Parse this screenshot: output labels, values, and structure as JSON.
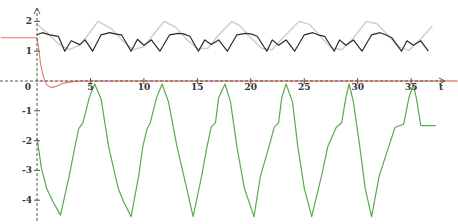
{
  "chart_data": {
    "type": "line",
    "title": "",
    "xlabel": "t",
    "ylabel": "",
    "xlim": [
      -3.4,
      39.3
    ],
    "ylim": [
      -4.7,
      2.6
    ],
    "x_ticks": [
      0,
      5,
      10,
      15,
      20,
      25,
      30,
      35
    ],
    "x_tick_labels": [
      "0",
      "5",
      "10",
      "15",
      "20",
      "25",
      "30",
      "35"
    ],
    "y_ticks": [
      2,
      1,
      -1,
      -2,
      -3,
      -4
    ],
    "y_tick_labels": [
      "2",
      "1",
      "-1",
      "-2",
      "-3",
      "-4"
    ],
    "grid": false,
    "legend": null,
    "colors": {
      "axis": "#555555",
      "black_curve": "#2a2a2a",
      "gray_curve": "#cccccc",
      "red_curve": "#e07a6a",
      "red_zero_line": "#f3a8a0",
      "green_curve": "#5aaa50"
    },
    "series": [
      {
        "name": "gray-sinusoid",
        "description": "faint gray sinusoid, period ~2π",
        "x": [
          0,
          1,
          2,
          3,
          4,
          5,
          5.7,
          7,
          8,
          9,
          10,
          11,
          11.9,
          13,
          14,
          15,
          16,
          17,
          18.2,
          19,
          20,
          21,
          22,
          23,
          24.5,
          25.5,
          26.5,
          27.5,
          28.5,
          29.5,
          30.8,
          31.8,
          32.8,
          33.8,
          34.8,
          36,
          37
        ],
        "y": [
          1.9,
          1.6,
          1.25,
          1.05,
          1.2,
          1.65,
          2.0,
          1.75,
          1.35,
          1.05,
          1.15,
          1.6,
          2.0,
          1.8,
          1.4,
          1.08,
          1.1,
          1.55,
          2.0,
          1.85,
          1.45,
          1.1,
          1.05,
          1.45,
          2.0,
          1.9,
          1.5,
          1.12,
          1.05,
          1.4,
          2.0,
          1.92,
          1.55,
          1.15,
          1.02,
          1.45,
          1.85
        ]
      },
      {
        "name": "black-oscillation",
        "description": "dark curve with double dips each period",
        "x": [
          0,
          0.5,
          1.2,
          2,
          2.6,
          3.2,
          4,
          4.5,
          5.2,
          6,
          6.8,
          7.3,
          7.9,
          8.8,
          9.4,
          10,
          10.7,
          11.5,
          12.4,
          13.2,
          13.7,
          14.3,
          15.1,
          15.7,
          16.3,
          17,
          17.8,
          18.7,
          19.5,
          20,
          20.6,
          21.5,
          22,
          22.6,
          23.3,
          24.1,
          25,
          25.8,
          26.3,
          26.9,
          27.8,
          28.3,
          28.9,
          29.6,
          30.4,
          31.3,
          32.1,
          32.6,
          33.2,
          34.1,
          34.6,
          35.2,
          35.9,
          36.6
        ],
        "y": [
          1.55,
          1.62,
          1.55,
          1.5,
          1.0,
          1.35,
          1.22,
          1.38,
          1.0,
          1.55,
          1.62,
          1.58,
          1.55,
          1.0,
          1.4,
          1.2,
          1.38,
          1.0,
          1.55,
          1.6,
          1.58,
          1.5,
          1.0,
          1.38,
          1.22,
          1.38,
          1.0,
          1.55,
          1.6,
          1.58,
          1.5,
          1.0,
          1.38,
          1.2,
          1.38,
          1.0,
          1.55,
          1.62,
          1.55,
          1.5,
          1.0,
          1.38,
          1.2,
          1.38,
          1.0,
          1.55,
          1.62,
          1.55,
          1.45,
          1.0,
          1.35,
          1.2,
          1.35,
          1.0
        ]
      },
      {
        "name": "red-transient",
        "description": "red curve decaying from ~1.5 to 0 with small undershoot",
        "x": [
          -3.4,
          0,
          0.15,
          0.35,
          0.6,
          0.9,
          1.3,
          1.8,
          2.5,
          3.3,
          4.2,
          5,
          39.3
        ],
        "y": [
          1.45,
          1.45,
          1.1,
          0.55,
          0.15,
          -0.12,
          -0.22,
          -0.18,
          -0.07,
          -0.02,
          0.0,
          0.0,
          0.0
        ]
      },
      {
        "name": "green-response",
        "description": "green periodic curve, period ~2π, peaks ~-0.1, troughs ~-4.55",
        "x": [
          0,
          0.4,
          0.9,
          1.5,
          2.2,
          3.0,
          3.5,
          3.9,
          4.3,
          4.9,
          5.4,
          6.0,
          6.7,
          7.6,
          8.1,
          8.8,
          9.5,
          9.9,
          10.3,
          10.6,
          11.2,
          11.7,
          12.3,
          13.1,
          14.0,
          14.6,
          15.4,
          15.9,
          16.3,
          16.7,
          17.0,
          17.6,
          18.1,
          18.7,
          19.4,
          20.3,
          20.9,
          21.7,
          22.2,
          22.6,
          22.9,
          23.3,
          23.9,
          24.4,
          25.0,
          25.7,
          26.6,
          27.2,
          28.0,
          28.5,
          28.9,
          29.2,
          29.6,
          30.2,
          30.7,
          31.3,
          32.0,
          32.9,
          33.5,
          34.3,
          34.8,
          35.2,
          35.5,
          35.9,
          36.5,
          37.0,
          37.3
        ],
        "y": [
          -1.9,
          -2.9,
          -3.6,
          -4.05,
          -4.5,
          -3.2,
          -2.3,
          -1.6,
          -1.4,
          -0.55,
          -0.1,
          -0.6,
          -2.2,
          -3.6,
          -4.05,
          -4.55,
          -3.2,
          -2.2,
          -1.6,
          -1.4,
          -0.55,
          -0.1,
          -0.7,
          -2.2,
          -3.6,
          -4.55,
          -3.2,
          -2.2,
          -1.55,
          -1.4,
          -0.55,
          -0.1,
          -0.7,
          -2.2,
          -3.6,
          -4.55,
          -3.2,
          -2.2,
          -1.55,
          -1.4,
          -0.55,
          -0.1,
          -0.7,
          -2.2,
          -3.6,
          -4.55,
          -3.2,
          -2.2,
          -1.55,
          -1.4,
          -0.55,
          -0.1,
          -0.7,
          -2.2,
          -3.6,
          -4.55,
          -3.2,
          -2.2,
          -1.55,
          -1.45,
          -0.55,
          -0.12,
          -0.6,
          -1.5,
          -1.5,
          -1.5,
          -1.5
        ]
      }
    ]
  }
}
